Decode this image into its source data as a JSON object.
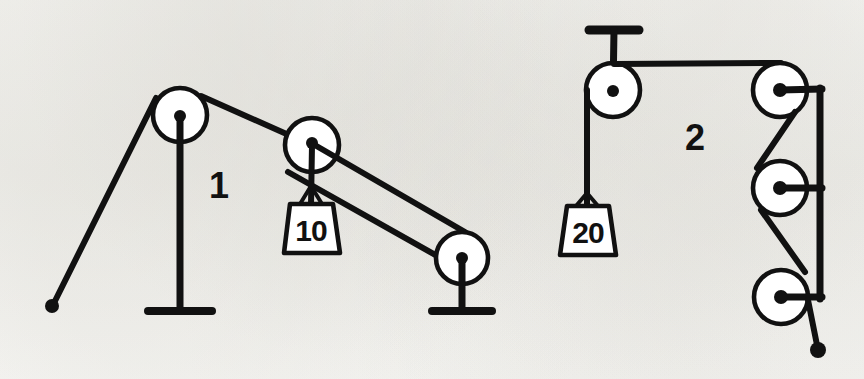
{
  "figure": {
    "background_color": "#fbfbf9",
    "ink_color": "#111111",
    "width": 864,
    "height": 379
  },
  "diagrams": [
    {
      "number": "1",
      "number_label": "1",
      "number_position": {
        "x": 219,
        "y": 198
      },
      "weight": {
        "label": "10",
        "units": "",
        "box": {
          "x": 283,
          "y": 203,
          "width": 56,
          "height": 50
        },
        "text_position": {
          "x": 311,
          "y": 240
        }
      },
      "pulleys": [
        {
          "name": "fixed-pulley-left",
          "cx": 180,
          "cy": 115,
          "r": 27,
          "mount": "floor-post"
        },
        {
          "name": "movable-pulley",
          "cx": 312,
          "cy": 145,
          "r": 27,
          "mount": "weight-hanger"
        },
        {
          "name": "fixed-pulley-right",
          "cx": 462,
          "cy": 258,
          "r": 26,
          "mount": "floor-post"
        }
      ],
      "anchor_point": {
        "x": 52,
        "y": 305,
        "name": "rope-end-anchor"
      },
      "supports": [
        {
          "name": "floor-post-left",
          "x": 180,
          "top": 115,
          "bottom": 312,
          "base_half_width": 32
        },
        {
          "name": "floor-post-right",
          "x": 462,
          "top": 258,
          "bottom": 312,
          "base_half_width": 30
        }
      ]
    },
    {
      "number": "2",
      "number_label": "2",
      "number_position": {
        "x": 685,
        "y": 150
      },
      "weight": {
        "label": "20",
        "units": "",
        "box": {
          "x": 560,
          "y": 205,
          "width": 56,
          "height": 50
        },
        "text_position": {
          "x": 588,
          "y": 242
        }
      },
      "pulleys": [
        {
          "name": "ceiling-pulley",
          "cx": 613,
          "cy": 90,
          "r": 27,
          "mount": "ceiling-bracket"
        },
        {
          "name": "frame-pulley-top",
          "cx": 780,
          "cy": 90,
          "r": 27,
          "mount": "frame-bar"
        },
        {
          "name": "frame-pulley-middle",
          "cx": 780,
          "cy": 188,
          "r": 27,
          "mount": "frame-bar"
        },
        {
          "name": "frame-pulley-bottom",
          "cx": 781,
          "cy": 297,
          "r": 27,
          "mount": "frame-bar"
        }
      ],
      "anchor_point": {
        "x": 818,
        "y": 350,
        "name": "rope-end-anchor"
      },
      "supports": [
        {
          "name": "ceiling-bracket",
          "x": 613,
          "top": 28,
          "bottom": 90,
          "bar_half_width": 24
        },
        {
          "name": "frame-bar-vertical",
          "x": 820,
          "top": 88,
          "bottom": 297
        }
      ]
    }
  ],
  "icons": {
    "pulley": "pulley-wheel-icon",
    "weight": "hanging-weight-icon",
    "anchor": "rope-end-dot-icon",
    "post": "support-post-icon"
  }
}
